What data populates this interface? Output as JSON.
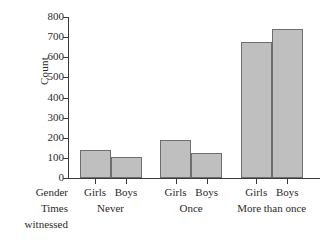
{
  "chart_data": {
    "type": "bar",
    "title": "",
    "xlabel": "",
    "ylabel": "Count",
    "ylim": [
      0,
      800
    ],
    "ytick_labels": [
      "800",
      "700",
      "600",
      "500",
      "400",
      "300",
      "200",
      "100",
      "0"
    ],
    "yticks": [
      800,
      700,
      600,
      500,
      400,
      300,
      200,
      100,
      0
    ],
    "grid": false,
    "legend": "none",
    "row_headers": {
      "gender": "Gender",
      "times_line1": "Times",
      "times_line2": "witnessed"
    },
    "categories": [
      "Never",
      "Once",
      "More than once"
    ],
    "series": [
      {
        "name": "Girls",
        "values": [
          140,
          190,
          675
        ]
      },
      {
        "name": "Boys",
        "values": [
          105,
          125,
          738
        ]
      }
    ],
    "bars": [
      {
        "group": "Never",
        "gender": "Girls",
        "value": 140
      },
      {
        "group": "Never",
        "gender": "Boys",
        "value": 105
      },
      {
        "group": "Once",
        "gender": "Girls",
        "value": 190
      },
      {
        "group": "Once",
        "gender": "Boys",
        "value": 125
      },
      {
        "group": "More than once",
        "gender": "Girls",
        "value": 675
      },
      {
        "group": "More than once",
        "gender": "Boys",
        "value": 738
      }
    ],
    "colors": {
      "bar_fill": "#bfbfbf",
      "bar_stroke": "#6e6e6e",
      "axis": "#3a3a3a",
      "text": "#2b2b2b",
      "background": "#ffffff"
    }
  }
}
